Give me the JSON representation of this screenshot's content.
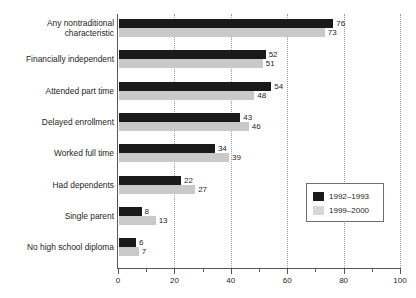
{
  "chart_data": {
    "type": "bar",
    "orientation": "horizontal",
    "title": "",
    "xlabel": "",
    "ylabel": "",
    "xlim": [
      0,
      100
    ],
    "grid": "vertical-dotted",
    "legend_position": "right-lower",
    "categories": [
      "Any nontraditional characteristic",
      "Financially independent",
      "Attended part time",
      "Delayed enrollment",
      "Worked full time",
      "Had dependents",
      "Single parent",
      "No high school diploma"
    ],
    "category_lines": [
      [
        "Any nontraditional",
        "characteristic"
      ],
      [
        "Financially independent"
      ],
      [
        "Attended part time"
      ],
      [
        "Delayed enrollment"
      ],
      [
        "Worked full time"
      ],
      [
        "Had dependents"
      ],
      [
        "Single parent"
      ],
      [
        "No high school diploma"
      ]
    ],
    "series": [
      {
        "name": "1992–1993",
        "color": "#1a1a1a",
        "values": [
          76,
          52,
          54,
          43,
          34,
          22,
          8,
          6
        ]
      },
      {
        "name": "1999–2000",
        "color": "#c9c9c9",
        "values": [
          73,
          51,
          48,
          46,
          39,
          27,
          13,
          7
        ]
      }
    ],
    "x_ticks_major": [
      0,
      20,
      40,
      60,
      80,
      100
    ],
    "x_tick_labels": [
      "0",
      "20",
      "40",
      "60",
      "80",
      "100"
    ],
    "x_ticks_minor": [
      10,
      30,
      50,
      70,
      90
    ]
  },
  "legend": {
    "entries": [
      {
        "label": "1992–1993"
      },
      {
        "label": "1999–2000"
      }
    ]
  }
}
